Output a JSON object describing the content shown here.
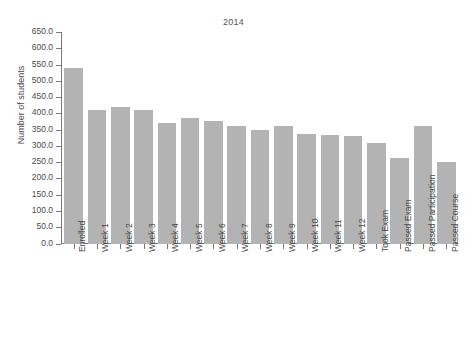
{
  "chart_data": {
    "type": "bar",
    "title": "2014",
    "xlabel": "",
    "ylabel": "Number of students",
    "ylim": [
      0,
      650
    ],
    "ytick_labels": [
      "0.0",
      "50.0",
      "100.0",
      "150.0",
      "200.0",
      "250.0",
      "300.0",
      "350.0",
      "400.0",
      "450.0",
      "500.0",
      "550.0",
      "600.0",
      "650.0"
    ],
    "ytick_values": [
      0,
      50,
      100,
      150,
      200,
      250,
      300,
      350,
      400,
      450,
      500,
      550,
      600,
      650
    ],
    "grid": false,
    "legend": "none",
    "bar_color": "#b3b3b3",
    "categories": [
      "Enrolled",
      "Week 1",
      "Week 2",
      "Week 3",
      "Week 4",
      "Week 5",
      "Week 6",
      "Week 7",
      "Week 8",
      "Week 9",
      "Week 10",
      "Week 11",
      "Week 12",
      "Took Exam",
      "Passed Exam",
      "Passed Participation",
      "Passed Course"
    ],
    "values": [
      540,
      410,
      419,
      411,
      369,
      387,
      378,
      361,
      350,
      361,
      336,
      334,
      330,
      308,
      262,
      362,
      252
    ]
  }
}
